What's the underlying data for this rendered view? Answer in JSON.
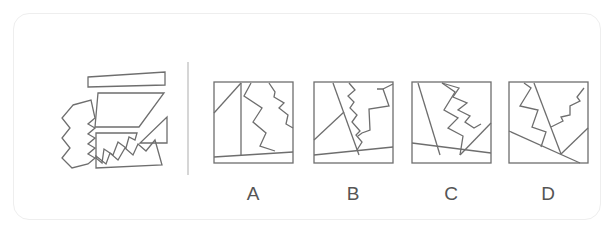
{
  "puzzle": {
    "type": "figure-assembly",
    "question_pieces_label": "pieces",
    "pieces": [
      {
        "id": "top-sliver",
        "points": "88,77 165,72 165,85 88,87"
      },
      {
        "id": "trapezoid",
        "points": "98,93 164,93 139,127 95,127"
      },
      {
        "id": "small-triangle",
        "points": "167,117 167,143 140,143"
      },
      {
        "id": "zigzag-left-strip",
        "points": "73,105 91,100 95,118 88,124 95,128 88,134 95,138 88,144 95,148 88,154 95,158 88,164 72,168 62,158 70,148 62,138 70,128 62,118"
      },
      {
        "id": "zigzag-upper",
        "points": "96,133 137,133 135,140 129,137 126,148 118,142 113,155 104,149 102,163 96,158"
      },
      {
        "id": "zigzag-lower",
        "points": "96,156 106,164 110,153 118,160 125,148 133,155 138,144 146,151 155,140 162,165 96,168"
      }
    ],
    "options": [
      {
        "label": "A",
        "box": {
          "x": 214,
          "y": 82,
          "w": 79,
          "h": 81
        },
        "lines": [
          "214,113 241,83",
          "241,83 241,156",
          "214,157 293,152",
          "251,83 244,96 262,108 253,122 266,133 260,146 275,151",
          "269,83 275,92 274,97 284,103 279,108 288,115 286,124 293,128"
        ]
      },
      {
        "label": "B",
        "box": {
          "x": 314,
          "y": 82,
          "w": 79,
          "h": 81
        },
        "lines": [
          "314,140 344,112",
          "333,83 359,155",
          "314,155 393,147",
          "349,83 355,90 348,96 354,102 350,108 357,115 352,122 360,131 356,135 362,142 357,150",
          "383,89 393,84",
          "377,89 383,89 389,106 369,109 370,130 362,133 358,136"
        ]
      },
      {
        "label": "C",
        "box": {
          "x": 412,
          "y": 82,
          "w": 79,
          "h": 81
        },
        "lines": [
          "418,83 440,155",
          "412,143 491,153",
          "442,83 459,88 453,97 467,103 458,110 470,116 465,122 474,128 481,124",
          "442,83 455,92 444,110 458,118 448,128 463,136 460,155",
          "460,155 491,123"
        ]
      },
      {
        "label": "D",
        "box": {
          "x": 509,
          "y": 82,
          "w": 79,
          "h": 81
        },
        "lines": [
          "509,131 580,163",
          "534,83 561,154",
          "561,154 588,128",
          "524,83 531,88 520,106 538,110 532,127 546,132 541,147",
          "584,88 577,97 580,101 570,106 570,115 561,117 563,121 551,127"
        ]
      }
    ]
  },
  "labels": {
    "A": "A",
    "B": "B",
    "C": "C",
    "D": "D"
  },
  "colors": {
    "stroke": "#6e6e6e",
    "divider": "#c8c8c8",
    "frame_border": "#eeeeee",
    "label_text": "#555555"
  }
}
